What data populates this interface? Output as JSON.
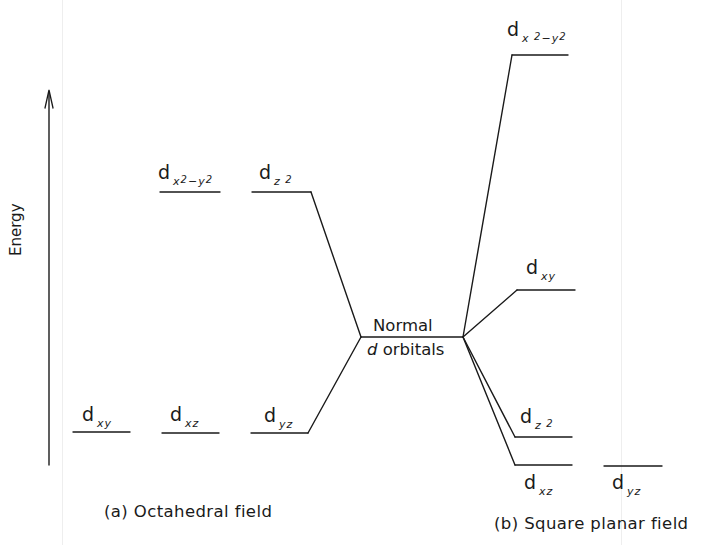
{
  "diagram": {
    "axis_label": "Energy",
    "center": {
      "line1": "Normal",
      "line2_italic": "d",
      "line2_rest": " orbitals"
    },
    "octahedral": {
      "caption": "(a) Octahedral field",
      "upper": [
        {
          "d": "d",
          "sub": "x",
          "sup1": "2",
          "mid": "−y",
          "sup2": "2"
        },
        {
          "d": "d",
          "sub": "z",
          "sup1": "2"
        }
      ],
      "lower": [
        {
          "d": "d",
          "sub": "xy"
        },
        {
          "d": "d",
          "sub": "xz"
        },
        {
          "d": "d",
          "sub": "yz"
        }
      ]
    },
    "square_planar": {
      "caption": "(b) Square planar field",
      "levels": [
        {
          "d": "d",
          "sub": "x",
          "sup1": "2",
          "mid": "−y",
          "sup2": "2"
        },
        {
          "d": "d",
          "sub": "xy"
        },
        {
          "d": "d",
          "sub": "z",
          "sup1": "2"
        },
        {
          "d": "d",
          "sub": "xz"
        },
        {
          "d": "d",
          "sub": "yz"
        }
      ]
    },
    "line_color": "#1a1a1a"
  }
}
